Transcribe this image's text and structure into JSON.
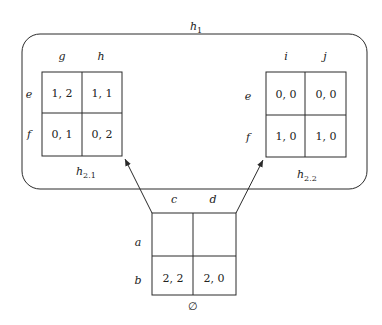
{
  "diagram": {
    "outer_group": {
      "label": "h",
      "label_sub": "1"
    },
    "matrices": {
      "h21": {
        "label": "h",
        "label_sub": "2.1",
        "columns": [
          "g",
          "h"
        ],
        "rows": [
          "e",
          "f"
        ],
        "cells": [
          [
            "1, 2",
            "1, 1"
          ],
          [
            "0, 1",
            "0, 2"
          ]
        ]
      },
      "h22": {
        "label": "h",
        "label_sub": "2.2",
        "columns": [
          "i",
          "j"
        ],
        "rows": [
          "e",
          "f"
        ],
        "cells": [
          [
            "0, 0",
            "0, 0"
          ],
          [
            "1, 0",
            "1, 0"
          ]
        ]
      },
      "root": {
        "label": "∅",
        "columns": [
          "c",
          "d"
        ],
        "rows": [
          "a",
          "b"
        ],
        "cells": [
          [
            "",
            ""
          ],
          [
            "2, 2",
            "2, 0"
          ]
        ]
      }
    },
    "edges": [
      {
        "from": "root",
        "to": "h21"
      },
      {
        "from": "root",
        "to": "h22"
      }
    ],
    "colors": {
      "stroke": "#2a2a2a",
      "text": "#222222",
      "background": "#ffffff"
    }
  }
}
